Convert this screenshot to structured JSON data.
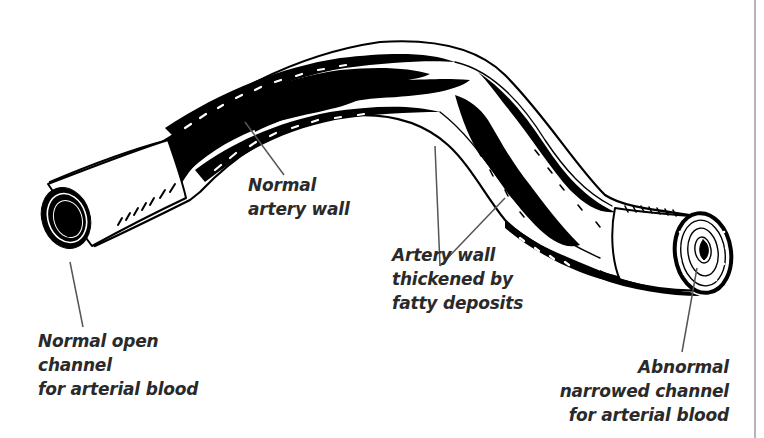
{
  "diagram": {
    "colors": {
      "ink": "#000000",
      "leader_line": "#555555",
      "label_text": "#2a2a2a",
      "border": "#b5b5b5",
      "background": "#ffffff"
    },
    "labels": {
      "normal_wall": {
        "lines": [
          "Normal",
          "artery wall"
        ]
      },
      "thickened_wall": {
        "lines": [
          "Artery wall",
          "thickened by",
          "fatty deposits"
        ]
      },
      "normal_channel": {
        "lines": [
          "Normal open",
          "channel",
          "for arterial blood"
        ]
      },
      "abnormal_channel": {
        "lines": [
          "Abnormal",
          "narrowed channel",
          "for arterial blood"
        ]
      }
    }
  }
}
